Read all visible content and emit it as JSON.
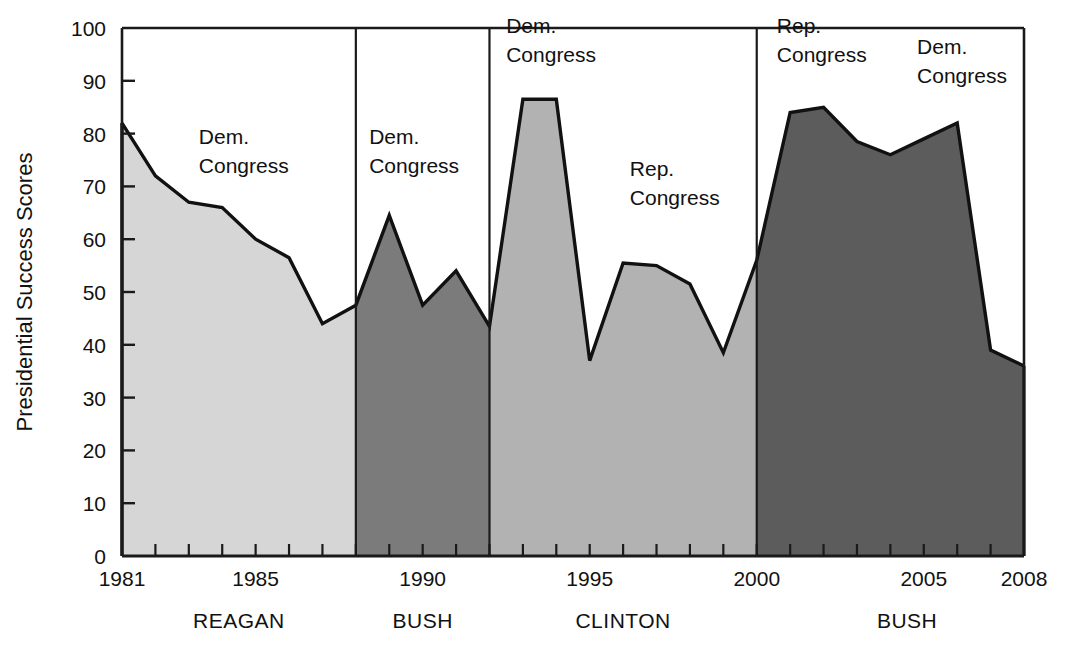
{
  "chart_data": {
    "type": "area",
    "title": "",
    "xlabel": "",
    "ylabel": "Presidential Success Scores",
    "ylim": [
      0,
      100
    ],
    "xlim": [
      1981,
      2008
    ],
    "grid": false,
    "legend_position": "none",
    "ytick_labels": [
      "0",
      "10",
      "20",
      "30",
      "40",
      "50",
      "60",
      "70",
      "80",
      "90",
      "100"
    ],
    "ytick_values": [
      0,
      10,
      20,
      30,
      40,
      50,
      60,
      70,
      80,
      90,
      100
    ],
    "xtick_labels": [
      "1981",
      "1985",
      "1990",
      "1995",
      "2000",
      "2005",
      "2008"
    ],
    "xtick_values": [
      1981,
      1985,
      1990,
      1995,
      2000,
      2005,
      2008
    ],
    "x": [
      1981,
      1982,
      1983,
      1984,
      1985,
      1986,
      1987,
      1988,
      1989,
      1990,
      1991,
      1992,
      1993,
      1994,
      1995,
      1996,
      1997,
      1998,
      1999,
      2000,
      2001,
      2002,
      2003,
      2004,
      2005,
      2006,
      2007,
      2008
    ],
    "values": [
      82,
      72,
      67,
      66,
      60,
      56.5,
      44,
      47.5,
      64.5,
      47.5,
      54,
      43.5,
      86.5,
      86.5,
      37,
      55.5,
      55,
      51.5,
      38.5,
      56,
      84,
      85,
      78.5,
      76,
      79,
      82,
      39,
      36
    ],
    "series": [
      {
        "name": "Presidential Success Scores",
        "values": [
          82,
          72,
          67,
          66,
          60,
          56.5,
          44,
          47.5,
          64.5,
          47.5,
          54,
          43.5,
          86.5,
          86.5,
          37,
          55.5,
          55,
          51.5,
          38.5,
          56,
          84,
          85,
          78.5,
          76,
          79,
          82,
          39,
          36
        ]
      }
    ],
    "eras": [
      {
        "label": "REAGAN",
        "start_year": 1981,
        "end_year": 1988,
        "fill_color": "#d6d6d6",
        "center_year": 1984.5
      },
      {
        "label": "BUSH",
        "start_year": 1988,
        "end_year": 1992,
        "fill_color": "#7b7b7b",
        "center_year": 1990.0
      },
      {
        "label": "CLINTON",
        "start_year": 1992,
        "end_year": 2000,
        "fill_color": "#b2b2b2",
        "center_year": 1996.0
      },
      {
        "label": "BUSH",
        "start_year": 2000,
        "end_year": 2008,
        "fill_color": "#5c5c5c",
        "center_year": 2004.5
      }
    ],
    "annotations": [
      {
        "text_line1": "Dem.",
        "text_line2": "Congress",
        "at_year": 1983.3,
        "at_value": 78
      },
      {
        "text_line1": "Dem.",
        "text_line2": "Congress",
        "at_year": 1988.4,
        "at_value": 78
      },
      {
        "text_line1": "Dem.",
        "text_line2": "Congress",
        "at_year": 1992.5,
        "at_value": 99
      },
      {
        "text_line1": "Rep.",
        "text_line2": "Congress",
        "at_year": 1996.2,
        "at_value": 72
      },
      {
        "text_line1": "Rep.",
        "text_line2": "Congress",
        "at_year": 2000.6,
        "at_value": 99
      },
      {
        "text_line1": "Dem.",
        "text_line2": "Congress",
        "at_year": 2004.8,
        "at_value": 95
      }
    ],
    "divider_years": [
      1988,
      1992,
      2000
    ]
  },
  "axes": {
    "y_axis_title": "Presidential Success Scores"
  },
  "colors": {
    "plot_border": "#1a1a1a",
    "line": "#111111",
    "background": "#ffffff",
    "reagan_fill": "#d6d6d6",
    "bush1_fill": "#7b7b7b",
    "clinton_fill": "#b2b2b2",
    "bush2_fill": "#5c5c5c"
  }
}
